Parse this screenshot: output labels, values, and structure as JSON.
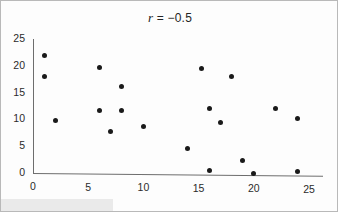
{
  "figure": {
    "title_prefix": "r",
    "title_rest": " = −0.5",
    "title_full": "r = −0.5"
  },
  "chart_data": {
    "type": "scatter",
    "title": "r = −0.5",
    "xlabel": "",
    "ylabel": "",
    "xlim": [
      0,
      25
    ],
    "ylim": [
      0,
      25
    ],
    "xticks": [
      0,
      5,
      10,
      15,
      20,
      25
    ],
    "yticks": [
      0,
      5,
      10,
      15,
      20,
      25
    ],
    "grid": false,
    "legend": false,
    "marker": {
      "shape": "circle",
      "color": "#1a1a1a",
      "size_px": 5
    },
    "correlation": -0.5,
    "n_points": 19,
    "points": [
      {
        "x": 1,
        "y": 22
      },
      {
        "x": 1,
        "y": 18
      },
      {
        "x": 2,
        "y": 9.8
      },
      {
        "x": 6,
        "y": 19.7
      },
      {
        "x": 6,
        "y": 11.6
      },
      {
        "x": 7,
        "y": 7.8
      },
      {
        "x": 8,
        "y": 16.2
      },
      {
        "x": 8,
        "y": 11.6
      },
      {
        "x": 10,
        "y": 8.6
      },
      {
        "x": 14,
        "y": 4.5
      },
      {
        "x": 15.3,
        "y": 19.5
      },
      {
        "x": 16,
        "y": 12
      },
      {
        "x": 16,
        "y": 0.5
      },
      {
        "x": 17,
        "y": 9.5
      },
      {
        "x": 18,
        "y": 18
      },
      {
        "x": 19,
        "y": 2.4
      },
      {
        "x": 20,
        "y": 0
      },
      {
        "x": 22,
        "y": 12
      },
      {
        "x": 24,
        "y": 10.2
      },
      {
        "x": 24,
        "y": 0.2
      }
    ]
  }
}
